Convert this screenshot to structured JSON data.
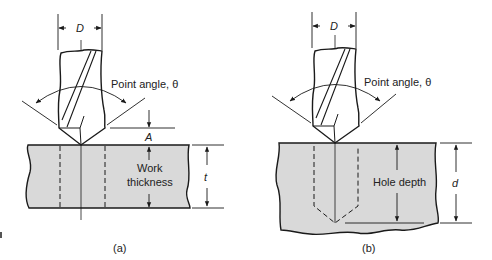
{
  "figure": {
    "panel_a": {
      "caption": "(a)",
      "diameter_label": "D",
      "point_angle_label": "Point angle, θ",
      "allowance_label": "A",
      "work_thickness_label_line1": "Work",
      "work_thickness_label_line2": "thickness",
      "thickness_label": "t"
    },
    "panel_b": {
      "caption": "(b)",
      "diameter_label": "D",
      "point_angle_label": "Point angle, θ",
      "hole_depth_label": "Hole depth",
      "depth_label": "d"
    },
    "colors": {
      "workpiece_fill": "#d9d9d9",
      "line": "#1a1a1a",
      "background": "#ffffff"
    }
  }
}
